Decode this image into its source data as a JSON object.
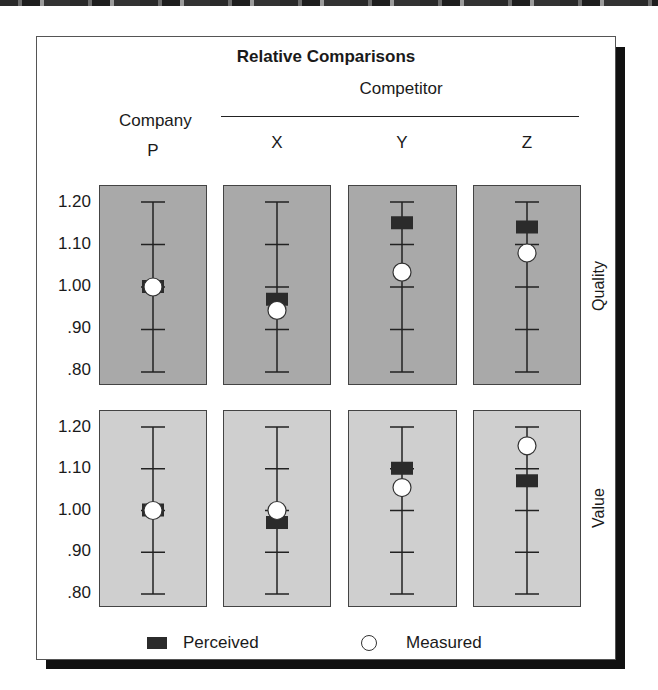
{
  "chart_data": {
    "type": "scatter",
    "title": "Relative Comparisons",
    "column_group_labels": {
      "company": "Company",
      "competitor": "Competitor"
    },
    "categories": [
      "P",
      "X",
      "Y",
      "Z"
    ],
    "rows": [
      "Quality",
      "Value"
    ],
    "ylim": [
      0.8,
      1.2
    ],
    "yticks": [
      1.2,
      1.1,
      1.0,
      0.9,
      0.8
    ],
    "ytick_labels": [
      "1.20",
      "1.10",
      "1.00",
      ".90",
      ".80"
    ],
    "series": [
      {
        "name": "Perceived",
        "marker": "square",
        "Quality": [
          1.0,
          0.97,
          1.15,
          1.14
        ],
        "Value": [
          1.0,
          0.97,
          1.1,
          1.07
        ]
      },
      {
        "name": "Measured",
        "marker": "circle",
        "Quality": [
          1.0,
          0.945,
          1.035,
          1.08
        ],
        "Value": [
          1.0,
          1.0,
          1.055,
          1.155
        ]
      }
    ],
    "legend": [
      "Perceived",
      "Measured"
    ],
    "legend_position": "bottom",
    "grid": false
  },
  "labels": {
    "title": "Relative Comparisons",
    "competitor": "Competitor",
    "company": "Company",
    "columns": [
      "P",
      "X",
      "Y",
      "Z"
    ],
    "row_quality": "Quality",
    "row_value": "Value",
    "yticks": [
      "1.20",
      "1.10",
      "1.00",
      ".90",
      ".80"
    ],
    "legend_perceived": "Perceived",
    "legend_measured": "Measured"
  },
  "colors": {
    "quality_panel": "#a9a9a9",
    "value_panel": "#cfcfcf",
    "perceived_marker": "#2b2b2b",
    "measured_marker": "#ffffff"
  }
}
